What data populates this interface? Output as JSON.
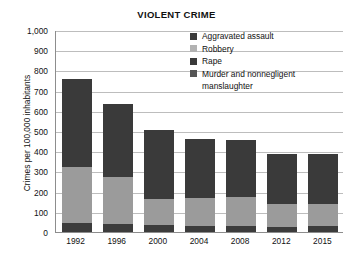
{
  "chart_data": {
    "type": "bar",
    "stacked": true,
    "title": "VIOLENT CRIME",
    "xlabel": "",
    "ylabel": "Crimes per 100,000 inhabitants",
    "categories": [
      "1992",
      "1996",
      "2000",
      "2004",
      "2008",
      "2012",
      "2015"
    ],
    "ylim": [
      0,
      1000
    ],
    "yticks": [
      "0",
      "100",
      "200",
      "300",
      "400",
      "500",
      "600",
      "700",
      "800",
      "900",
      "1,000"
    ],
    "ytick_values": [
      0,
      100,
      200,
      300,
      400,
      500,
      600,
      700,
      800,
      900,
      1000
    ],
    "grid": true,
    "legend_position": "top-right",
    "series": [
      {
        "name": "Murder and nonnegligent manslaughter",
        "color": "#3c3c3c",
        "values": [
          45,
          40,
          33,
          32,
          30,
          25,
          28
        ]
      },
      {
        "name": "Rape",
        "color": "#3c3c3c",
        "values": [
          0,
          0,
          0,
          0,
          0,
          0,
          0
        ]
      },
      {
        "name": "Robbery",
        "color": "#9b9b9b",
        "values": [
          279,
          232,
          130,
          136,
          141,
          113,
          112
        ]
      },
      {
        "name": "Aggravated assault",
        "color": "#3a3a3a",
        "values": [
          433,
          362,
          342,
          295,
          284,
          249,
          248
        ]
      }
    ],
    "totals": [
      757,
      634,
      505,
      463,
      455,
      387,
      388
    ],
    "annotations": []
  },
  "legend": {
    "items": [
      {
        "label": "Aggravated assault",
        "color": "#3a3a3a"
      },
      {
        "label": "Robbery",
        "color": "#b2b2b2"
      },
      {
        "label": "Rape",
        "color": "#3a3a3a"
      },
      {
        "label": "Murder and nonnegligent",
        "label_cont": "manslaughter",
        "color": "#555555"
      }
    ]
  },
  "colors": {
    "dark": "#3a3a3a",
    "medium": "#555555",
    "gray": "#9b9b9b",
    "light_gray": "#b2b2b2",
    "axis": "#8d8d8d",
    "grid": "#bdbdbd",
    "text": "#111111",
    "background": "#ffffff"
  }
}
